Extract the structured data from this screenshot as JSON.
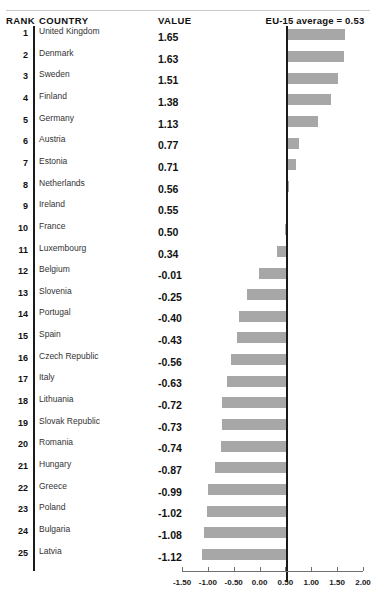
{
  "header": {
    "rank_label": "RANK",
    "country_label": "COUNTRY",
    "value_label": "VALUE",
    "reference_label": "EU-15 average = 0.53"
  },
  "chart_data": {
    "type": "bar",
    "orientation": "horizontal",
    "title": "",
    "xlabel": "",
    "ylabel": "",
    "reference_line": 0.53,
    "reference_line_label": "EU-15 average = 0.53",
    "xlim": [
      -1.5,
      2.0
    ],
    "xticks": [
      -1.5,
      -1.0,
      -0.5,
      0.0,
      0.5,
      1.0,
      1.5,
      2.0
    ],
    "xticklabels": [
      "-1.50",
      "-1.00",
      "-0.50",
      "0.00",
      "0.50",
      "1.00",
      "1.50",
      "2.00"
    ],
    "grid": false,
    "legend": false,
    "bar_color": "#a7a7a7",
    "axis_color": "#1a1a1a",
    "ranks": [
      1,
      2,
      3,
      4,
      5,
      6,
      7,
      8,
      9,
      10,
      11,
      12,
      13,
      14,
      15,
      16,
      17,
      18,
      19,
      20,
      21,
      22,
      23,
      24,
      25
    ],
    "categories": [
      "United Kingdom",
      "Denmark",
      "Sweden",
      "Finland",
      "Germany",
      "Austria",
      "Estonia",
      "Netherlands",
      "Ireland",
      "France",
      "Luxembourg",
      "Belgium",
      "Slovenia",
      "Portugal",
      "Spain",
      "Czech Republic",
      "Italy",
      "Lithuania",
      "Slovak Republic",
      "Romania",
      "Hungary",
      "Greece",
      "Poland",
      "Bulgaria",
      "Latvia"
    ],
    "values": [
      1.65,
      1.63,
      1.51,
      1.38,
      1.13,
      0.77,
      0.71,
      0.56,
      0.55,
      0.5,
      0.34,
      -0.01,
      -0.25,
      -0.4,
      -0.43,
      -0.56,
      -0.63,
      -0.72,
      -0.73,
      -0.74,
      -0.87,
      -0.99,
      -1.02,
      -1.08,
      -1.12
    ],
    "value_labels": [
      "1.65",
      "1.63",
      "1.51",
      "1.38",
      "1.13",
      "0.77",
      "0.71",
      "0.56",
      "0.55",
      "0.50",
      "0.34",
      "-0.01",
      "-0.25",
      "-0.40",
      "-0.43",
      "-0.56",
      "-0.63",
      "-0.72",
      "-0.73",
      "-0.74",
      "-0.87",
      "-0.99",
      "-1.02",
      "-1.08",
      "-1.12"
    ]
  }
}
